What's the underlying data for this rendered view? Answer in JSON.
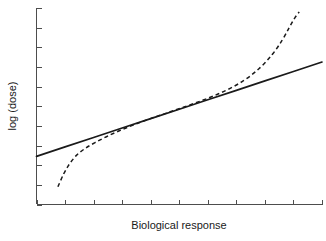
{
  "chart_data": {
    "type": "line",
    "title": "",
    "subtitle": "",
    "xlabel": "Biological response",
    "ylabel": "log (dose)",
    "grid": false,
    "legend": null,
    "legend_position": "none",
    "xlim": [
      0,
      10
    ],
    "ylim": [
      0,
      10
    ],
    "x_tick_labels": [],
    "y_tick_labels": [],
    "x_tick_count": 10,
    "y_tick_count": 10,
    "annotations": [],
    "colors": {
      "background": "#ffffff",
      "axis": "#4d4d4d",
      "series": "#1a1a1a"
    },
    "series": [
      {
        "name": "linear calibration line",
        "style": "solid",
        "x": [
          0.0,
          1.0,
          2.0,
          3.0,
          4.0,
          5.0,
          6.0,
          7.0,
          8.0,
          9.0,
          10.0
        ],
        "y": [
          2.45,
          2.93,
          3.41,
          3.89,
          4.37,
          4.85,
          5.33,
          5.81,
          6.29,
          6.77,
          7.25
        ]
      },
      {
        "name": "sigmoid dose-response curve",
        "style": "dashed",
        "x": [
          0.75,
          0.95,
          1.15,
          1.4,
          1.7,
          2.05,
          2.45,
          2.9,
          3.4,
          3.95,
          4.55,
          5.2,
          5.9,
          6.6,
          7.25,
          7.8,
          8.25,
          8.6,
          8.85,
          9.05,
          9.2
        ],
        "y": [
          0.9,
          1.55,
          2.05,
          2.5,
          2.85,
          3.15,
          3.45,
          3.75,
          4.05,
          4.35,
          4.65,
          4.98,
          5.35,
          5.78,
          6.3,
          6.92,
          7.62,
          8.35,
          9.0,
          9.5,
          9.8
        ]
      }
    ]
  },
  "labels": {
    "x_axis_title": "Biological response",
    "y_axis_title": "log (dose)"
  }
}
